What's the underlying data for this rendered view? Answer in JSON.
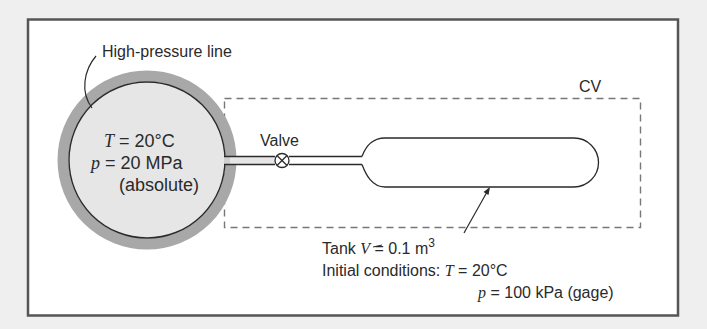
{
  "colors": {
    "page_background": "#efefef",
    "frame_fill": "#ffffff",
    "frame_stroke": "#555555",
    "ring": "#a8a8a8",
    "line_fill": "#e6e6e6",
    "stroke": "#2a2a2a",
    "cv_dash": "#777777"
  },
  "high_pressure_line": {
    "label": "High-pressure line",
    "temperature": {
      "symbol": "T",
      "eq": " = 20°C"
    },
    "pressure": {
      "symbol": "p",
      "eq": " = 20 MPa"
    },
    "pressure_note": "(absolute)"
  },
  "valve": {
    "label": "Valve"
  },
  "control_volume": {
    "label": "CV"
  },
  "tank": {
    "volume_prefix": "Tank ",
    "volume_symbol": "V",
    "volume_eq": " = 0.1 m",
    "volume_exp": "3",
    "initial_label": "Initial conditions: ",
    "initial_temperature": {
      "symbol": "T",
      "eq": " = 20°C"
    },
    "initial_pressure": {
      "symbol": "p",
      "eq": " = 100 kPa (gage)"
    }
  }
}
